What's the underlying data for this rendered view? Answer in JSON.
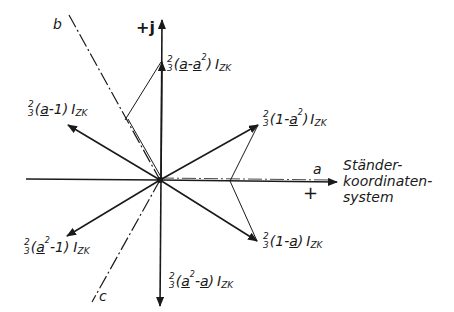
{
  "diagram": {
    "type": "phasor-diagram",
    "colors": {
      "ink": "#1a1a1a",
      "background": "#ffffff"
    },
    "axes": {
      "real": {
        "label": "a",
        "sign": "+",
        "system_label": [
          "Ständer-",
          "koordinaten-",
          "system"
        ]
      },
      "imag": {
        "label": "+j"
      },
      "b": {
        "label": "b"
      },
      "c": {
        "label": "c"
      }
    },
    "vectors": [
      {
        "id": "v1",
        "frac_num": "2",
        "frac_den": "3",
        "paren_open": "(",
        "term1": "a",
        "op": "-",
        "term2": "a",
        "term2_sup": "2",
        "paren_close": ")",
        "symbol": "I",
        "subscript": "ZK"
      },
      {
        "id": "v2",
        "frac_num": "2",
        "frac_den": "3",
        "paren_open": "(",
        "term1": "a",
        "op": "-",
        "term2": "1",
        "paren_close": ")",
        "symbol": "I",
        "subscript": "ZK"
      },
      {
        "id": "v3",
        "frac_num": "2",
        "frac_den": "3",
        "paren_open": "(",
        "term1": "1",
        "op": "-",
        "term2": "a",
        "term2_sup": "2",
        "paren_close": ")",
        "symbol": "I",
        "subscript": "ZK"
      },
      {
        "id": "v4",
        "frac_num": "2",
        "frac_den": "3",
        "paren_open": "(",
        "term1": "1",
        "op": "-",
        "term2": "a",
        "paren_close": ")",
        "symbol": "I",
        "subscript": "ZK"
      },
      {
        "id": "v5",
        "frac_num": "2",
        "frac_den": "3",
        "paren_open": "(",
        "term1": "a",
        "term1_sup": "2",
        "op": "-",
        "term2": "1",
        "paren_close": ")",
        "symbol": "I",
        "subscript": "ZK"
      },
      {
        "id": "v6",
        "frac_num": "2",
        "frac_den": "3",
        "paren_open": "(",
        "term1": "a",
        "term1_sup": "2",
        "op": "-",
        "term2": "a",
        "paren_close": ")",
        "symbol": "I",
        "subscript": "ZK"
      }
    ]
  }
}
